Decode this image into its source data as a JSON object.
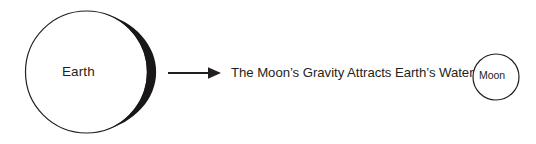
{
  "diagram": {
    "background_color": "#ffffff",
    "stroke_color": "#231f20",
    "fill_color": "#ffffff",
    "bulge_color": "#1a1718",
    "earth": {
      "label": "Earth",
      "shape": "circle",
      "center_x": 86.5,
      "center_y": 72,
      "radius": 61,
      "outline_width": 1.2,
      "bulge": {
        "name": "tidal-bulge-crescent",
        "side": "right",
        "max_thickness": 14
      }
    },
    "arrow": {
      "name": "gravity-arrow",
      "direction": "right",
      "start_x": 168,
      "end_x": 221,
      "y": 73,
      "line_width": 2,
      "head_length": 13,
      "head_width": 11
    },
    "statement": {
      "text": "The Moon’s Gravity Attracts Earth’s Water"
    },
    "moon": {
      "label": "Moon",
      "shape": "circle",
      "center_x": 496,
      "center_y": 77,
      "radius": 23,
      "outline_width": 1.2
    }
  }
}
